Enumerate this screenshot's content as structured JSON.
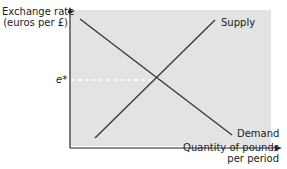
{
  "diagram": {
    "type": "supply-demand",
    "y_axis_label_line1": "Exchange rate",
    "y_axis_label_line2": "(euros per £)",
    "x_axis_label_line1": "Quantity of pounds",
    "x_axis_label_line2": "per period",
    "equilibrium_label": "e*",
    "curves": [
      {
        "name": "Supply",
        "slope": "upward"
      },
      {
        "name": "Demand",
        "slope": "downward"
      }
    ],
    "colors": {
      "plot_background": "#e3e3e3",
      "curve": "#3a3a3a",
      "axis": "#222222",
      "guide_line": "#ffffff"
    }
  }
}
